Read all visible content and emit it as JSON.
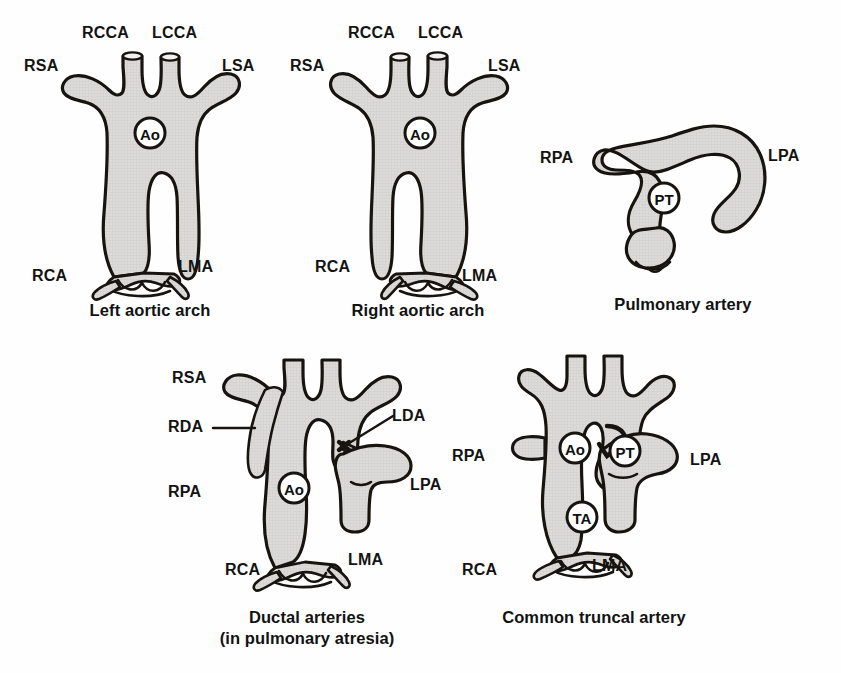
{
  "plate": {
    "title": "Great arteries — schematic plate",
    "background_color": "#fefefe",
    "vessel_fill_color": "#d9d9d9",
    "outline_color": "#17140f",
    "label_color": "#131313",
    "width": 841,
    "height": 673
  },
  "figures": [
    {
      "id": "left-aortic-arch",
      "caption": "Left aortic arch",
      "caption_lines": [
        "Left aortic arch"
      ],
      "center_tag": "Ao",
      "labels": [
        {
          "key": "rcca",
          "text": "RCCA"
        },
        {
          "key": "lcca",
          "text": "LCCA"
        },
        {
          "key": "rsa",
          "text": "RSA"
        },
        {
          "key": "lsa",
          "text": "LSA"
        },
        {
          "key": "rca",
          "text": "RCA"
        },
        {
          "key": "lma",
          "text": "LMA"
        }
      ]
    },
    {
      "id": "right-aortic-arch",
      "caption": "Right aortic arch",
      "caption_lines": [
        "Right aortic arch"
      ],
      "center_tag": "Ao",
      "labels": [
        {
          "key": "rcca",
          "text": "RCCA"
        },
        {
          "key": "lcca",
          "text": "LCCA"
        },
        {
          "key": "rsa",
          "text": "RSA"
        },
        {
          "key": "lsa",
          "text": "LSA"
        },
        {
          "key": "rca",
          "text": "RCA"
        },
        {
          "key": "lma",
          "text": "LMA"
        }
      ]
    },
    {
      "id": "pulmonary-artery",
      "caption": "Pulmonary artery",
      "caption_lines": [
        "Pulmonary artery"
      ],
      "center_tag": "PT",
      "labels": [
        {
          "key": "rpa",
          "text": "RPA"
        },
        {
          "key": "lpa",
          "text": "LPA"
        }
      ]
    },
    {
      "id": "ductal-arteries",
      "caption": "Ductal arteries (in pulmonary atresia)",
      "caption_lines": [
        "Ductal arteries",
        "(in pulmonary atresia)"
      ],
      "center_tag": "Ao",
      "labels": [
        {
          "key": "rsa",
          "text": "RSA"
        },
        {
          "key": "rda",
          "text": "RDA"
        },
        {
          "key": "rpa",
          "text": "RPA"
        },
        {
          "key": "lda",
          "text": "LDA"
        },
        {
          "key": "lpa",
          "text": "LPA"
        },
        {
          "key": "rca",
          "text": "RCA"
        },
        {
          "key": "lma",
          "text": "LMA"
        }
      ]
    },
    {
      "id": "common-truncal-artery",
      "caption": "Common truncal artery",
      "caption_lines": [
        "Common truncal artery"
      ],
      "center_tags": [
        "Ao",
        "PT",
        "TA"
      ],
      "labels": [
        {
          "key": "rpa",
          "text": "RPA"
        },
        {
          "key": "lpa",
          "text": "LPA"
        },
        {
          "key": "rca",
          "text": "RCA"
        },
        {
          "key": "lma",
          "text": "LMA"
        }
      ]
    }
  ],
  "abbreviations": {
    "RCCA": "RCCA",
    "LCCA": "LCCA",
    "RSA": "RSA",
    "LSA": "LSA",
    "RCA": "RCA",
    "LMA": "LMA",
    "RPA": "RPA",
    "LPA": "LPA",
    "RDA": "RDA",
    "LDA": "LDA",
    "Ao": "Ao",
    "PT": "PT",
    "TA": "TA"
  }
}
